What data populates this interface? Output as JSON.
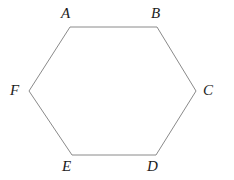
{
  "figure": {
    "kind": "geometry-diagram",
    "shape_name": "hexagon",
    "canvas": {
      "width": 234,
      "height": 180
    },
    "background_color": "#ffffff",
    "stroke_color": "#8a8a8a",
    "stroke_width": 1,
    "fill_color": "none",
    "label_color": "#1c1c1c",
    "vertices": [
      {
        "id": "A",
        "label": "A",
        "x": 70,
        "y": 27,
        "label_x": 61,
        "label_y": 6
      },
      {
        "id": "B",
        "label": "B",
        "x": 157,
        "y": 27,
        "label_x": 151,
        "label_y": 6
      },
      {
        "id": "C",
        "label": "C",
        "x": 196,
        "y": 91,
        "label_x": 203,
        "label_y": 83
      },
      {
        "id": "D",
        "label": "D",
        "x": 156,
        "y": 155,
        "label_x": 147,
        "label_y": 159
      },
      {
        "id": "E",
        "label": "E",
        "x": 72,
        "y": 155,
        "label_x": 62,
        "label_y": 159
      },
      {
        "id": "F",
        "label": "F",
        "x": 29,
        "y": 91,
        "label_x": 10,
        "label_y": 83
      }
    ],
    "edges": [
      {
        "from": "A",
        "to": "B"
      },
      {
        "from": "B",
        "to": "C"
      },
      {
        "from": "C",
        "to": "D"
      },
      {
        "from": "D",
        "to": "E"
      },
      {
        "from": "E",
        "to": "F"
      },
      {
        "from": "F",
        "to": "A"
      }
    ],
    "polygon_points": "70,27 157,27 196,91 156,155 72,155 29,91"
  }
}
